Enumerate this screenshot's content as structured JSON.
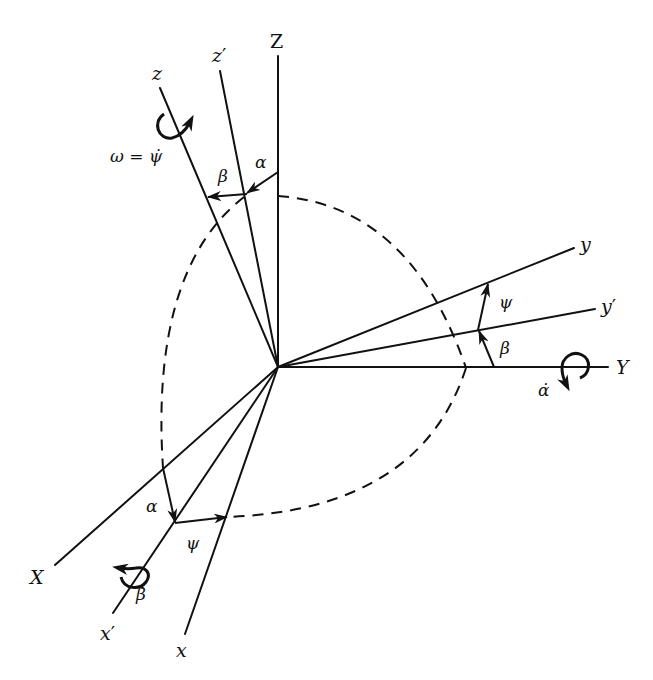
{
  "figure": {
    "type": "euler-angle rotation diagram",
    "origin": [
      278,
      367
    ],
    "colors": {
      "ink": "#111111",
      "background": "#ffffff"
    },
    "axes": [
      {
        "id": "Z",
        "label": "Z",
        "prime": "",
        "end": [
          278,
          56
        ],
        "label_pos": [
          270,
          48
        ],
        "upright": true
      },
      {
        "id": "z1",
        "label": "z",
        "prime": "′",
        "end": [
          220,
          71
        ],
        "label_pos": [
          212,
          62
        ],
        "upright": false
      },
      {
        "id": "z",
        "label": "z",
        "prime": "",
        "end": [
          160,
          88
        ],
        "label_pos": [
          152,
          80
        ],
        "upright": false
      },
      {
        "id": "Y",
        "label": "Y",
        "prime": "",
        "end": [
          608,
          367
        ],
        "label_pos": [
          618,
          374
        ],
        "upright": false
      },
      {
        "id": "y1",
        "label": "y",
        "prime": "′",
        "end": [
          595,
          309
        ],
        "label_pos": [
          603,
          313
        ],
        "upright": false
      },
      {
        "id": "y",
        "label": "y",
        "prime": "",
        "end": [
          574,
          248
        ],
        "label_pos": [
          582,
          251
        ],
        "upright": false
      },
      {
        "id": "X",
        "label": "X",
        "prime": "",
        "end": [
          55,
          565
        ],
        "label_pos": [
          30,
          584
        ],
        "upright": false
      },
      {
        "id": "x1",
        "label": "x",
        "prime": "′",
        "end": [
          113,
          613
        ],
        "label_pos": [
          100,
          640
        ],
        "upright": false
      },
      {
        "id": "x",
        "label": "x",
        "prime": "",
        "end": [
          185,
          634
        ],
        "label_pos": [
          176,
          657
        ],
        "upright": false
      }
    ],
    "angle_labels": [
      {
        "id": "alpha-top",
        "text": "α",
        "pos": [
          255,
          168
        ]
      },
      {
        "id": "beta-top",
        "text": "β",
        "pos": [
          218,
          180
        ]
      },
      {
        "id": "psi-right",
        "text": "ψ",
        "pos": [
          500,
          306
        ]
      },
      {
        "id": "beta-right",
        "text": "β",
        "pos": [
          500,
          352
        ]
      },
      {
        "id": "alpha-bottom",
        "text": "α",
        "pos": [
          148,
          510
        ]
      },
      {
        "id": "psi-bottom",
        "text": "ψ",
        "pos": [
          186,
          547
        ]
      }
    ],
    "rate_labels": [
      {
        "id": "omega-psidot",
        "text": "ω = ψ̇",
        "pos": [
          112,
          160
        ]
      },
      {
        "id": "alpha-dot",
        "text": "α̇",
        "pos": [
          540,
          392
        ]
      },
      {
        "id": "beta-dot",
        "text": "β̇",
        "pos": [
          136,
          598
        ]
      }
    ],
    "caption": ""
  }
}
